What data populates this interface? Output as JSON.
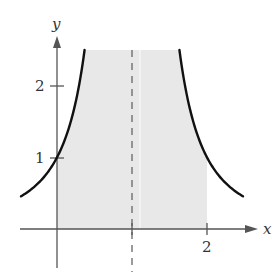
{
  "chart_data": {
    "type": "line",
    "title": "",
    "xlabel": "x",
    "ylabel": "y",
    "function": "y = 1/(x-1)^2",
    "xlim": [
      -0.48,
      2.65
    ],
    "ylim": [
      -0.5,
      2.7
    ],
    "x_ticks": [
      {
        "value": 2,
        "label": "2"
      }
    ],
    "y_ticks": [
      {
        "value": 1,
        "label": "1"
      },
      {
        "value": 2,
        "label": "2"
      }
    ],
    "vertical_asymptote": {
      "x": 1,
      "style": "dashed"
    },
    "shaded_region": {
      "x_from": 0,
      "x_to": 2,
      "y_from": 0,
      "y_to": 2.5,
      "color": "#e8e8e8",
      "description": "region under curve between x=0 and x=2"
    },
    "series": [
      {
        "name": "left branch",
        "x": [
          -0.48,
          -0.25,
          0,
          0.2,
          0.368
        ],
        "y": [
          0.46,
          0.64,
          1.0,
          1.56,
          2.5
        ]
      },
      {
        "name": "right branch",
        "x": [
          1.632,
          1.8,
          2,
          2.25,
          2.48
        ],
        "y": [
          2.5,
          1.56,
          1.0,
          0.64,
          0.46
        ]
      }
    ],
    "grid": false,
    "legend": null
  },
  "labels": {
    "x_axis": "x",
    "y_axis": "y",
    "tick_x2": "2",
    "tick_y1": "1",
    "tick_y2": "2"
  },
  "colors": {
    "curve": "#111111",
    "axis": "#555555",
    "shade": "#e8e8e8",
    "asymptote": "#666666"
  }
}
